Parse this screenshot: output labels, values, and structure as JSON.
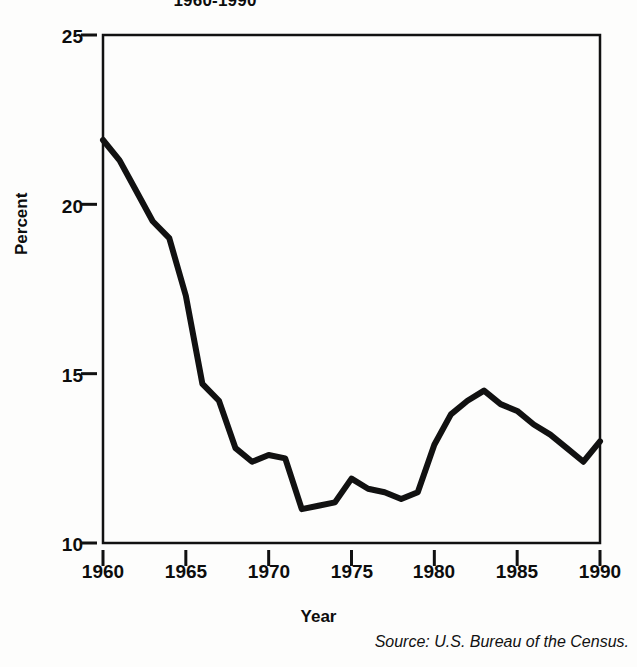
{
  "chart_data": {
    "type": "line",
    "title": "1960-1990",
    "xlabel": "Year",
    "ylabel": "Percent",
    "source": "Source: U.S. Bureau of the Census.",
    "grid": false,
    "legend": "none",
    "xlim": [
      1960,
      1990
    ],
    "ylim": [
      10,
      25
    ],
    "xticks": [
      1960,
      1965,
      1970,
      1975,
      1980,
      1985,
      1990
    ],
    "yticks": [
      10,
      15,
      20,
      25
    ],
    "x": [
      1960,
      1961,
      1962,
      1963,
      1964,
      1965,
      1966,
      1967,
      1968,
      1969,
      1970,
      1971,
      1972,
      1973,
      1974,
      1975,
      1976,
      1977,
      1978,
      1979,
      1980,
      1981,
      1982,
      1983,
      1984,
      1985,
      1986,
      1987,
      1988,
      1989,
      1990
    ],
    "values": [
      21.9,
      21.3,
      20.4,
      19.5,
      19.0,
      17.3,
      14.7,
      14.2,
      12.8,
      12.4,
      12.6,
      12.5,
      11.0,
      11.1,
      11.2,
      11.9,
      11.6,
      11.5,
      11.3,
      11.5,
      12.9,
      13.8,
      14.2,
      14.5,
      14.1,
      13.9,
      13.5,
      13.2,
      12.8,
      12.4,
      13.0
    ],
    "series_name": "Percent"
  },
  "axis": {
    "ytick_labels": [
      "25",
      "20",
      "15",
      "10"
    ],
    "xtick_labels": [
      "1960",
      "1965",
      "1970",
      "1975",
      "1980",
      "1985",
      "1990"
    ]
  },
  "colors": {
    "line": "#111111",
    "frame": "#111111",
    "background": "#fdfdfc"
  }
}
